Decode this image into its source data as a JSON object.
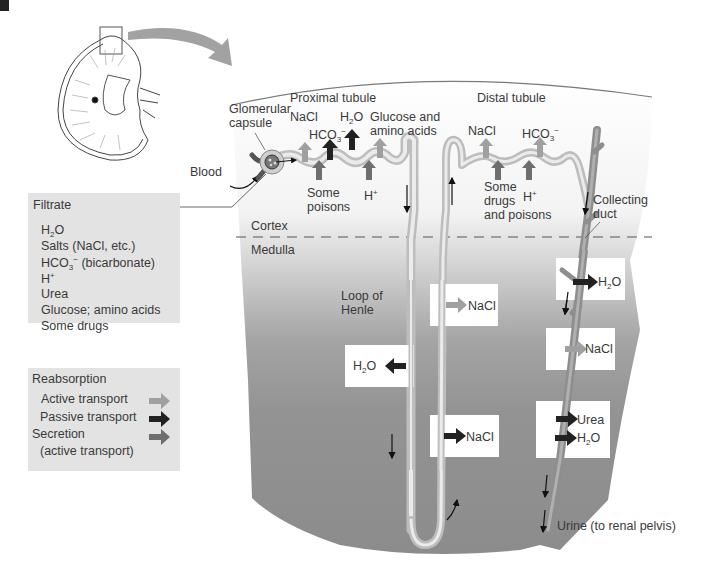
{
  "diagram": {
    "type": "kidney nephron function",
    "regions": {
      "cortex": "Cortex",
      "medulla": "Medulla"
    },
    "structures": {
      "glomerular_capsule": [
        "Glomerular",
        "capsule"
      ],
      "proximal_tubule": "Proximal tubule",
      "distal_tubule": "Distal tubule",
      "loop_of_henle": [
        "Loop of",
        "Henle"
      ],
      "collecting_duct": [
        "Collecting",
        "duct"
      ],
      "blood": "Blood",
      "urine": "Urine (to renal pelvis)"
    },
    "proximal_labels": {
      "nacl": "NaCl",
      "hco3": "HCO",
      "h2o": "H",
      "glucose": [
        "Glucose and",
        "amino acids"
      ],
      "some_poisons": [
        "Some",
        "poisons"
      ],
      "h_plus": "H"
    },
    "distal_labels": {
      "nacl": "NaCl",
      "hco3": "HCO",
      "some_drugs": [
        "Some",
        "drugs",
        "and poisons"
      ],
      "h_plus": "H"
    },
    "medulla_boxes": {
      "loop_nacl_upper": "NaCl",
      "loop_h2o": "H",
      "loop_nacl_lower": "NaCl",
      "duct_h2o_upper": "H",
      "duct_nacl": "NaCl",
      "duct_urea": "Urea",
      "duct_h2o_lower": "H"
    },
    "filtrate_panel": {
      "title": "Filtrate",
      "items": [
        "H2O",
        "Salts (NaCl, etc.)",
        "HCO3- (bicarbonate)",
        "H+",
        "Urea",
        "Glucose; amino acids",
        "Some drugs"
      ]
    },
    "legend": {
      "title": "Reabsorption",
      "items": [
        {
          "label": "Active transport",
          "color": "#9a9a9a"
        },
        {
          "label": "Passive transport",
          "color": "#222222"
        },
        {
          "label": "Secretion",
          "label2": "(active transport)",
          "color": "#6e6e6e"
        }
      ]
    },
    "text_parts": {
      "h": "H",
      "o": "O",
      "two": "2",
      "three": "3",
      "plus": "+",
      "minus": "−",
      "co": "HCO",
      "bicarb": " (bicarbonate)"
    },
    "colors": {
      "active": "#9a9a9a",
      "passive": "#222222",
      "secretion": "#6e6e6e",
      "panel_bg": "#e3e3e3",
      "medulla_dark": "#8a8a8a",
      "tubule": "#d2d2d2",
      "duct": "#9a9a9a"
    }
  }
}
